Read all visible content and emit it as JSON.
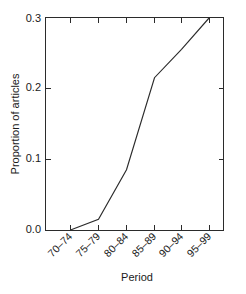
{
  "chart_data": {
    "type": "line",
    "title": "",
    "subtitle": "",
    "xlabel": "Period",
    "ylabel": "Proportion of articles",
    "categories": [
      "70–74",
      "75–79",
      "80–84",
      "85–89",
      "90–94",
      "95–99"
    ],
    "values": [
      0.0,
      0.015,
      0.085,
      0.215,
      0.255,
      0.3
    ],
    "series": [
      {
        "name": "Proportion of articles",
        "values": [
          0.0,
          0.015,
          0.085,
          0.215,
          0.255,
          0.3
        ]
      }
    ],
    "ylim": [
      0.0,
      0.3
    ],
    "ytick_values": [
      0.0,
      0.1,
      0.2,
      0.3
    ],
    "ytick_labels": [
      "0.0",
      "0.1",
      "0.2",
      "0.3"
    ],
    "xtick_labels": [
      "70–74",
      "75–79",
      "80–84",
      "85–89",
      "90–94",
      "95–99"
    ],
    "xtick_rotation": 45,
    "grid": false,
    "legend": false,
    "legend_position": "none",
    "line_color": "#2b2b2b",
    "axis_color": "#2b2b2b",
    "background_color": "#ffffff",
    "frame": "box",
    "tick_direction": "in",
    "markers": false,
    "annotations": []
  },
  "axes": {
    "y_title": "Proportion of articles",
    "x_title": "Period"
  }
}
